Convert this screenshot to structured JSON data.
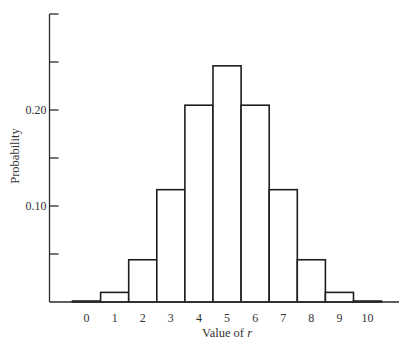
{
  "chart_data": {
    "type": "bar",
    "title": "",
    "xlabel": "Value of r",
    "xlabel_prefix": "Value of ",
    "xlabel_var": "r",
    "ylabel": "Probability",
    "categories": [
      "0",
      "1",
      "2",
      "3",
      "4",
      "5",
      "6",
      "7",
      "8",
      "9",
      "10"
    ],
    "values": [
      0.001,
      0.01,
      0.044,
      0.117,
      0.205,
      0.246,
      0.205,
      0.117,
      0.044,
      0.01,
      0.001
    ],
    "ylim": [
      0,
      0.3
    ],
    "yticks": [
      0.05,
      0.1,
      0.15,
      0.2,
      0.25,
      0.3
    ],
    "ytick_labels": {
      "0.10": "0.10",
      "0.20": "0.20"
    },
    "grid": false,
    "legend": null,
    "bar_width": "full (adjacent, histogram style)"
  },
  "colors": {
    "bar_fill": "#ffffff",
    "bar_stroke": "#1e1e1e",
    "axis": "#2a2a2a",
    "text": "#333333"
  }
}
